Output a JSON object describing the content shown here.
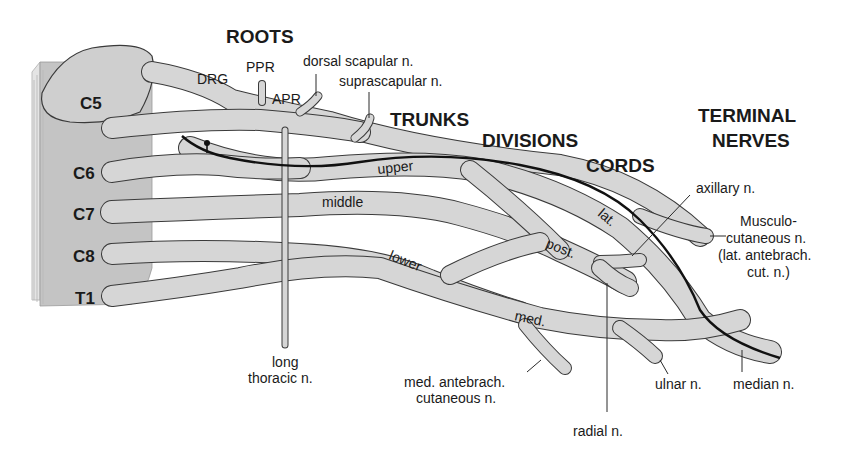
{
  "diagram": {
    "headings": {
      "roots": "ROOTS",
      "trunks": "TRUNKS",
      "divisions": "DIVISIONS",
      "cords": "CORDS",
      "terminal_line1": "TERMINAL",
      "terminal_line2": "NERVES"
    },
    "spinal_segments": [
      "C5",
      "C6",
      "C7",
      "C8",
      "T1"
    ],
    "root_parts": {
      "drg": "DRG",
      "ppr": "PPR",
      "apr": "APR"
    },
    "trunks": {
      "upper": "upper",
      "middle": "middle",
      "lower": "lower"
    },
    "cords": {
      "lateral": "lat.",
      "posterior": "post.",
      "medial": "med."
    },
    "nerves": {
      "dorsal_scapular": "dorsal scapular n.",
      "suprascapular": "suprascapular n.",
      "long_thoracic_line1": "long",
      "long_thoracic_line2": "thoracic n.",
      "axillary": "axillary n.",
      "musculocutaneous_line1": "Musculo-",
      "musculocutaneous_line2": "cutaneous n.",
      "musculocutaneous_line3": "(lat. antebrach.",
      "musculocutaneous_line4": "cut. n.)",
      "med_antebrach_line1": "med. antebrach.",
      "med_antebrach_line2": "cutaneous n.",
      "radial": "radial n.",
      "ulnar": "ulnar n.",
      "median": "median n."
    },
    "colors": {
      "nerve_fill": "#d6d6d6",
      "cord_fill": "#c4c4c4",
      "outline": "#3a3a3a",
      "text": "#1a1a1a",
      "highlight_path": "#111111"
    }
  }
}
